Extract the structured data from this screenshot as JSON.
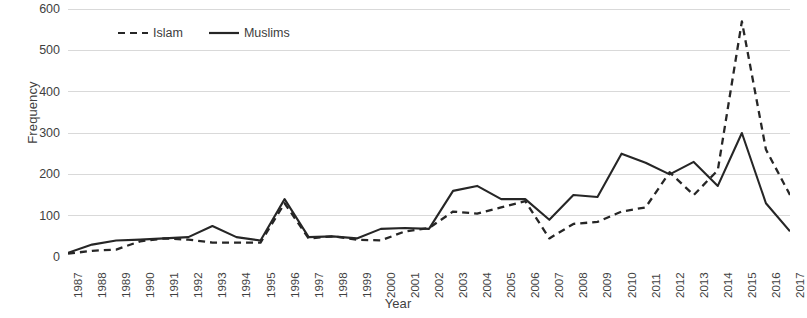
{
  "chart_data": {
    "type": "line",
    "title": "",
    "xlabel": "Year",
    "ylabel": "Frequency",
    "x": [
      1987,
      1988,
      1989,
      1990,
      1991,
      1992,
      1993,
      1994,
      1995,
      1996,
      1997,
      1998,
      1999,
      2000,
      2001,
      2002,
      2003,
      2004,
      2005,
      2006,
      2007,
      2008,
      2009,
      2010,
      2011,
      2012,
      2013,
      2014,
      2015,
      2016,
      2017
    ],
    "xlim": [
      1987,
      2017
    ],
    "ylim": [
      0,
      600
    ],
    "yticks": [
      0,
      100,
      200,
      300,
      400,
      500,
      600
    ],
    "ytick_labels": [
      "0",
      "100",
      "200",
      "300",
      "400",
      "500",
      "600"
    ],
    "grid": true,
    "grid_axis": "y",
    "legend_position": "top-left",
    "series": [
      {
        "name": "Islam",
        "style": "dashed",
        "color": "#262626",
        "values": [
          8,
          15,
          18,
          38,
          45,
          42,
          35,
          35,
          35,
          130,
          45,
          50,
          42,
          40,
          62,
          70,
          110,
          105,
          120,
          135,
          45,
          80,
          85,
          110,
          120,
          205,
          150,
          210,
          570,
          260,
          150
        ]
      },
      {
        "name": "Muslims",
        "style": "solid",
        "color": "#262626",
        "values": [
          10,
          30,
          40,
          42,
          45,
          48,
          75,
          48,
          40,
          140,
          48,
          50,
          45,
          68,
          70,
          68,
          160,
          172,
          140,
          140,
          90,
          150,
          145,
          250,
          228,
          200,
          230,
          172,
          300,
          130,
          62
        ]
      }
    ]
  },
  "axes": {
    "y_title": "Frequency",
    "x_title": "Year"
  },
  "legend": {
    "items": [
      {
        "label": "Islam",
        "style": "dashed"
      },
      {
        "label": "Muslims",
        "style": "solid"
      }
    ]
  }
}
